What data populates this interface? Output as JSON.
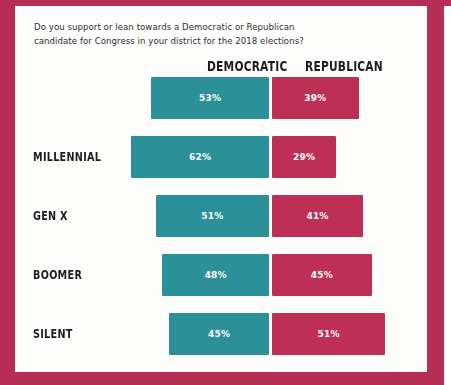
{
  "page": {
    "frame_color": "#b62e54",
    "sheet_color": "#fdfdfc"
  },
  "question": {
    "line1": "Do you support or lean towards a Democratic or Republican",
    "line2": "candidate for Congress in your district for the 2018 elections?"
  },
  "headers": {
    "democratic": "DEMOCRATIC",
    "republican": "REPUBLICAN"
  },
  "rows": [
    {
      "label": "",
      "dem": "53%",
      "rep": "39%"
    },
    {
      "label": "MILLENNIAL",
      "dem": "62%",
      "rep": "29%"
    },
    {
      "label": "GEN X",
      "dem": "51%",
      "rep": "41%"
    },
    {
      "label": "BOOMER",
      "dem": "48%",
      "rep": "45%"
    },
    {
      "label": "SILENT",
      "dem": "45%",
      "rep": "51%"
    }
  ],
  "chart_data": {
    "type": "bar",
    "title": "Do you support or lean towards a Democratic or Republican candidate for Congress in your district for the 2018 elections?",
    "orientation": "horizontal-diverging",
    "categories": [
      "All",
      "Millennial",
      "Gen X",
      "Boomer",
      "Silent"
    ],
    "tick_labels": [
      "",
      "MILLENNIAL",
      "GEN X",
      "BOOMER",
      "SILENT"
    ],
    "series": [
      {
        "name": "DEMOCRATIC",
        "color": "#2b9098",
        "direction": "left",
        "values": [
          53,
          62,
          51,
          48,
          45
        ]
      },
      {
        "name": "REPUBLICAN",
        "color": "#be2f55",
        "direction": "right",
        "values": [
          39,
          29,
          41,
          45,
          51
        ]
      }
    ],
    "value_suffix": "%",
    "xlabel": "",
    "ylabel": "",
    "xlim": [
      0,
      70
    ],
    "grid": false,
    "legend": "top",
    "legend_entries": [
      "DEMOCRATIC",
      "REPUBLICAN"
    ],
    "data_labels": true
  }
}
